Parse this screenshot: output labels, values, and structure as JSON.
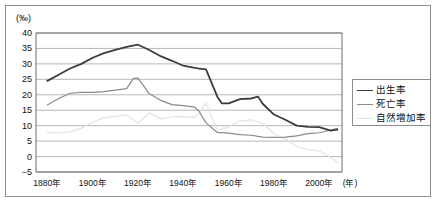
{
  "figure": {
    "y_unit_label": "(‰)",
    "x_unit_label": "(年)"
  },
  "legend": {
    "position": "right",
    "items": [
      {
        "label": "出生率",
        "color": "#3c3c3c",
        "width": 1.8
      },
      {
        "label": "死亡率",
        "color": "#8a8a8a",
        "width": 1.2
      },
      {
        "label": "自然増加率",
        "color": "#e2e2e2",
        "width": 1.2
      }
    ]
  },
  "chart_data": {
    "type": "line",
    "title": "",
    "xlabel": "(年)",
    "ylabel": "(‰)",
    "xlim": [
      1875,
      2010
    ],
    "ylim": [
      -5,
      40
    ],
    "ytick_step": 5,
    "grid": true,
    "legend_position": "right",
    "yticks": [
      40,
      35,
      30,
      25,
      20,
      15,
      10,
      5,
      0,
      -5
    ],
    "ytick_labels": [
      "40",
      "35",
      "30",
      "25",
      "20",
      "15",
      "10",
      "5",
      "0",
      "−5"
    ],
    "xticks": [
      1880,
      1900,
      1920,
      1940,
      1960,
      1980,
      2000
    ],
    "xtick_labels": [
      "1880年",
      "1900年",
      "1920年",
      "1940年",
      "1960年",
      "1980年",
      "2000年"
    ],
    "series": [
      {
        "name": "出生率",
        "color": "#3c3c3c",
        "width": 1.8,
        "x": [
          1880,
          1885,
          1890,
          1895,
          1900,
          1905,
          1910,
          1915,
          1920,
          1925,
          1930,
          1935,
          1940,
          1945,
          1947,
          1950,
          1955,
          1957,
          1960,
          1965,
          1970,
          1973,
          1975,
          1980,
          1985,
          1990,
          1995,
          2000,
          2005,
          2008
        ],
        "values": [
          24.5,
          26.5,
          28.5,
          30.0,
          32.0,
          33.5,
          34.5,
          35.5,
          36.2,
          34.5,
          32.5,
          31.0,
          29.4,
          28.7,
          28.5,
          28.2,
          19.4,
          17.2,
          17.2,
          18.6,
          18.8,
          19.4,
          17.1,
          13.6,
          11.9,
          10.0,
          9.6,
          9.5,
          8.4,
          8.7
        ],
        "annotation": "birth rate per 1000 population"
      },
      {
        "name": "死亡率",
        "color": "#8a8a8a",
        "width": 1.2,
        "x": [
          1880,
          1885,
          1890,
          1895,
          1900,
          1905,
          1910,
          1915,
          1918,
          1920,
          1925,
          1930,
          1935,
          1940,
          1945,
          1947,
          1950,
          1955,
          1960,
          1965,
          1970,
          1975,
          1980,
          1985,
          1990,
          1995,
          2000,
          2005,
          2008
        ],
        "values": [
          16.7,
          18.8,
          20.5,
          20.8,
          20.8,
          21.0,
          21.5,
          22.0,
          25.3,
          25.4,
          20.3,
          18.2,
          16.8,
          16.5,
          16.0,
          14.6,
          10.9,
          7.8,
          7.6,
          7.1,
          6.9,
          6.3,
          6.2,
          6.3,
          6.7,
          7.4,
          7.7,
          8.6,
          9.1
        ],
        "annotation": "death rate per 1000 population"
      },
      {
        "name": "自然増加率",
        "color": "#e2e2e2",
        "width": 1.2,
        "x": [
          1880,
          1885,
          1890,
          1895,
          1900,
          1905,
          1910,
          1915,
          1920,
          1925,
          1930,
          1935,
          1940,
          1945,
          1947,
          1950,
          1955,
          1960,
          1965,
          1970,
          1975,
          1980,
          1985,
          1990,
          1995,
          2000,
          2005,
          2008
        ],
        "values": [
          7.8,
          7.7,
          8.0,
          9.2,
          11.2,
          12.5,
          13.0,
          13.5,
          10.8,
          14.2,
          12.2,
          12.8,
          12.9,
          12.7,
          13.9,
          17.3,
          8.5,
          9.6,
          11.5,
          11.9,
          10.8,
          7.4,
          5.6,
          3.3,
          2.2,
          1.8,
          -0.2,
          -2.0
        ],
        "annotation": "rate of natural increase"
      }
    ]
  }
}
